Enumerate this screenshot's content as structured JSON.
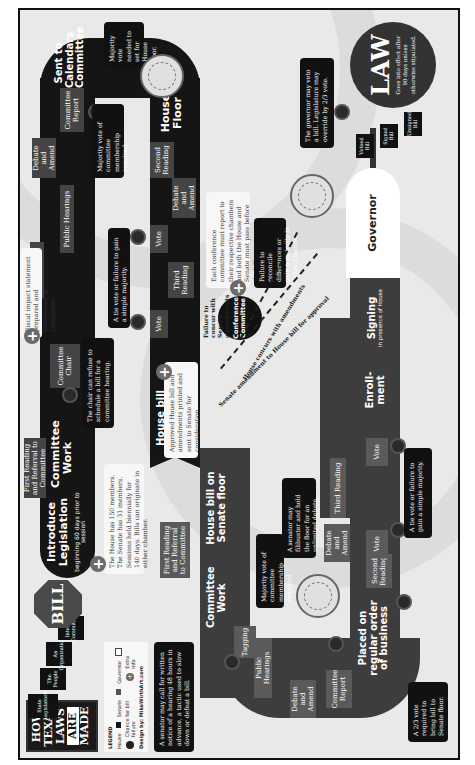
{
  "title": {
    "line1": "HOW",
    "line2": "TEXAS",
    "line3": "LAWS",
    "line4": "ARE",
    "line5": "MADE"
  },
  "legend": {
    "heading": "LEGEND",
    "house": "House",
    "senate": "Senate",
    "governor": "Governor",
    "chance": "Chance for bill failure",
    "extra": "Extra Info",
    "credit": "Design by: MikeWirthArt.com"
  },
  "sources": [
    "State Legislators",
    "The People",
    "An Organization",
    "Interim Committee"
  ],
  "bill": "BILL",
  "introduce": {
    "title": "Introduce Legislation",
    "sub": "beginning 60 days prior to session"
  },
  "notes": {
    "house_members": "The House has 150 members. The Senate has 31 members. Sessions held biennially for 140 days. Bills can originate in either chamber.",
    "fiscal": "Fiscal impact statement prepared and distributed to committee.",
    "chair_refuse": "The chair can refuse to schedule a bill for a committee hearing.",
    "house_majority": "Majority vote of committee membership required.",
    "calendars_vote": "Majority vote needed to set for House floor.",
    "house_tie": "A tie vote or failure to gain a simple majority.",
    "conference_each": "Each conference committee must report to their respective chambers and both the House and Senate must pass before the bill goes to enrollment.",
    "conference_fail": "Failure to reconcile differences or gain a majority in either chamber.",
    "approved_sent": "Approved House bill and amendments printed and sent to Senate for consideration.",
    "tagging": "A senator may call for written notice of a hearing 48 hours in advance, a tactic used to slow down or defeat a bill.",
    "senate_majority": "Majority vote of committee membership required.",
    "filibuster": "A senator may filibuster and hold the floor for an unlimited debate.",
    "senate_tie": "A tie vote or failure to gain a simple majority.",
    "two_thirds": "A 2/3 vote required to bring bill to Senate floor.",
    "veto": "The governor may veto a bill. Legislature may override by 2/3 vote."
  },
  "house": {
    "first_reading": "First Reading and Referral to Committee",
    "committee_work": "Committee Work",
    "committee_chair": "Committee Chair",
    "bill_analysis": "Bill Analysis",
    "public_hearings": "Public Hearings",
    "debate_amend": "Debate and Amend",
    "committee_report": "Committee Report",
    "sent_calendars": "Sent to Calendars Committee",
    "house_floor": "House Floor",
    "second_reading": "Second Reading",
    "floor_debate": "Debate and Amend",
    "vote1": "Vote",
    "third_reading": "Third Reading",
    "vote2": "Vote",
    "sent_senate": "House bill sent to Senate"
  },
  "senate": {
    "on_floor": "House bill on Senate floor",
    "first_reading": "First Reading and Referral to Committee",
    "committee_work": "Committee Work",
    "tagging": "Tagging",
    "public_hearings": "Public Hearings",
    "debate_amend": "Debate and Amend",
    "committee_report": "Committee Report",
    "regular_order": "Placed on regular order of business",
    "second_reading": "Second Reading",
    "floor_debate": "Debate and Amend",
    "vote1": "Vote",
    "third_reading": "Third Reading",
    "vote2": "Vote"
  },
  "conference": {
    "label": "Conference Committee",
    "failure": "Failure to concur with Senate amendments",
    "arrow1": "House concurs with amendments",
    "arrow2": "Senate amendment to House bill for approval"
  },
  "end": {
    "enrollment": "Enroll-ment",
    "signing": "Signing",
    "signing_sub": "in presence of House",
    "governor": "Governor",
    "vetoed": "Vetoed Bill",
    "signed": "Signed Bill",
    "unsigned": "Unsigned Bill",
    "law": "LAW",
    "law_sub": "Goes into effect after 90 days unless otherwise stipulated."
  }
}
